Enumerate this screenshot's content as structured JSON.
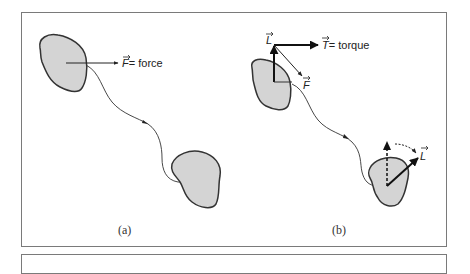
{
  "figure": {
    "panels": [
      {
        "id": "a",
        "caption": "(a)",
        "force_symbol": "F",
        "force_label": "= force"
      },
      {
        "id": "b",
        "caption": "(b)",
        "angular_momentum_symbol": "L",
        "torque_symbol": "T",
        "torque_label": "= torque",
        "force_symbol": "F",
        "final_angular_momentum_symbol": "L"
      }
    ],
    "colors": {
      "body_fill": "#d4d4d4",
      "body_stroke": "#333333",
      "frame": "#7a7a7a",
      "ink": "#222222"
    }
  }
}
